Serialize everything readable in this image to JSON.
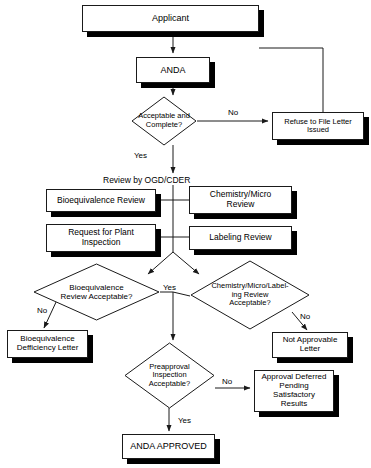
{
  "diagram": {
    "type": "flowchart",
    "colors": {
      "stroke": "#1a1a1a",
      "fill": "#ffffff",
      "shadow": "#000000",
      "text": "#000000"
    }
  },
  "nodes": {
    "applicant": {
      "label": "Applicant",
      "shape": "process"
    },
    "anda": {
      "label": "ANDA",
      "shape": "process"
    },
    "acceptable_complete": {
      "label": "Acceptable and\nComplete?",
      "line1": "Acceptable and",
      "line2": "Complete?",
      "shape": "decision"
    },
    "refuse_to_file": {
      "line1": "Refuse to File Letter",
      "line2": "Issued",
      "shape": "process"
    },
    "review_by_ogd": {
      "label": "Review by OGD/CDER",
      "shape": "text"
    },
    "bioequivalence_review": {
      "label": "Bioequivalence Review",
      "shape": "process"
    },
    "chemistry_micro_review": {
      "line1": "Chemistry/Micro",
      "line2": "Review",
      "shape": "process"
    },
    "request_plant_inspection": {
      "line1": "Request for Plant",
      "line2": "Inspection",
      "shape": "process"
    },
    "labeling_review": {
      "label": "Labeling Review",
      "shape": "process"
    },
    "bio_review_acceptable": {
      "line1": "Bioequivalence",
      "line2": "Review Acceptable?",
      "shape": "decision"
    },
    "chem_micro_label_acceptable": {
      "line1": "Chemistry/Micro/Label-",
      "line2": "ing Review",
      "line3": "Acceptable?",
      "shape": "decision"
    },
    "bio_deficiency_letter": {
      "line1": "Bioequivalence",
      "line2": "Defficiency Letter",
      "shape": "process"
    },
    "not_approvable_letter": {
      "line1": "Not Approvable",
      "line2": "Letter",
      "shape": "process"
    },
    "preapproval_inspection": {
      "line1": "Preapproval",
      "line2": "Inspection",
      "line3": "Acceptable?",
      "shape": "decision"
    },
    "approval_deferred": {
      "line1": "Approval Deferred",
      "line2": "Pending",
      "line3": "Satisfactory Results",
      "shape": "process"
    },
    "anda_approved": {
      "label": "ANDA APPROVED",
      "shape": "process"
    }
  },
  "edge_labels": {
    "no_acceptable_complete": "No",
    "yes_acceptable_complete": "Yes",
    "no_bio_review": "No",
    "yes_reviews": "Yes",
    "no_chem_micro": "No",
    "no_preapproval": "No",
    "yes_preapproval": "Yes"
  }
}
